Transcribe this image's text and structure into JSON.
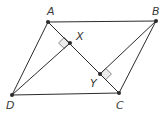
{
  "diagram": {
    "type": "geometry",
    "shape": "parallelogram",
    "points": {
      "A": {
        "label": "A",
        "x": 48,
        "y": 22,
        "lx": 47,
        "ly": 15
      },
      "B": {
        "label": "B",
        "x": 156,
        "y": 21,
        "lx": 152,
        "ly": 15
      },
      "C": {
        "label": "C",
        "x": 119,
        "y": 93,
        "lx": 116,
        "ly": 109
      },
      "D": {
        "label": "D",
        "x": 12,
        "y": 95,
        "lx": 6,
        "ly": 109
      },
      "X": {
        "label": "X",
        "x": 70,
        "y": 43,
        "lx": 76,
        "ly": 40
      },
      "Y": {
        "label": "Y",
        "x": 100,
        "y": 74,
        "lx": 90,
        "ly": 87
      }
    },
    "segments": [
      "AB",
      "BC",
      "CD",
      "DA",
      "AC",
      "DX",
      "BY"
    ],
    "right_angles": [
      "AXD",
      "CYB"
    ],
    "colors": {
      "line": "#2b2b2b",
      "marker_fill": "#ececec",
      "label": "#3a3a3a"
    }
  }
}
